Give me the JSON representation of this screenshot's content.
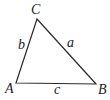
{
  "diagram": {
    "type": "triangle",
    "vertices": [
      {
        "id": "A",
        "label": "A",
        "x": 16,
        "y": 83,
        "label_x": 5,
        "label_y": 93
      },
      {
        "id": "B",
        "label": "B",
        "x": 96,
        "y": 84,
        "label_x": 98,
        "label_y": 94
      },
      {
        "id": "C",
        "label": "C",
        "x": 37,
        "y": 19,
        "label_x": 31,
        "label_y": 14
      }
    ],
    "sides": [
      {
        "id": "a",
        "label": "a",
        "from": "C",
        "to": "B",
        "label_x": 67,
        "label_y": 47
      },
      {
        "id": "b",
        "label": "b",
        "from": "A",
        "to": "C",
        "label_x": 18,
        "label_y": 49
      },
      {
        "id": "c",
        "label": "c",
        "from": "A",
        "to": "B",
        "label_x": 54,
        "label_y": 94
      }
    ],
    "stroke_color": "#2a2a2a",
    "label_color": "#222222"
  }
}
